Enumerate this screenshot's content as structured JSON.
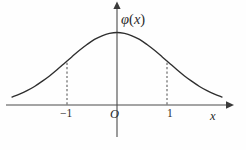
{
  "figure": {
    "kind": "math-plot",
    "width": 246,
    "height": 150,
    "background_color": "#fefefe",
    "curve_color": "#2e2e2e",
    "axis_color": "#4a4a4a",
    "dash_color": "#555555",
    "label_color": "#2b2b2b"
  },
  "labels": {
    "y_axis": "φ",
    "y_axis_arg_open": "(",
    "y_axis_arg": "x",
    "y_axis_arg_close": ")",
    "y_axis_full": "φ(x)",
    "origin": "O",
    "x_axis": "x",
    "tick_negative_one": "−1",
    "tick_positive_one": "1"
  },
  "bleed_through": {
    "top": "",
    "bottom": ""
  },
  "chart_data": {
    "type": "line",
    "title": "",
    "xlabel": "x",
    "ylabel": "φ(x)",
    "function": "phi(x) = (1/sqrt(2*pi)) * exp(-x^2/2)",
    "xlim": [
      -2.1,
      2.1
    ],
    "ylim": [
      0,
      0.46
    ],
    "grid": false,
    "legend": null,
    "xticks": [
      -1,
      1
    ],
    "xticklabels": [
      "−1",
      "1"
    ],
    "yticks": [],
    "yticklabels": [],
    "annotations": [
      {
        "text": "O",
        "x": 0,
        "y": 0,
        "role": "origin-marker"
      },
      {
        "text": "φ(x)",
        "x": 0,
        "y": 0.44,
        "role": "y-axis-label"
      },
      {
        "text": "x",
        "x": 2.0,
        "y": 0,
        "role": "x-axis-label"
      }
    ],
    "dashed_markers": [
      {
        "x": -1,
        "y_from": 0,
        "y_to": 0.242,
        "label": "−1"
      },
      {
        "x": 1,
        "y_from": 0,
        "y_to": 0.242,
        "label": "1"
      }
    ],
    "x": [
      -2.1,
      -1.95,
      -1.8,
      -1.65,
      -1.5,
      -1.35,
      -1.2,
      -1.05,
      -1.0,
      -0.9,
      -0.75,
      -0.6,
      -0.45,
      -0.3,
      -0.15,
      0.0,
      0.15,
      0.3,
      0.45,
      0.6,
      0.75,
      0.9,
      1.0,
      1.05,
      1.2,
      1.35,
      1.5,
      1.65,
      1.8,
      1.95,
      2.1
    ],
    "y": [
      0.044,
      0.06,
      0.079,
      0.102,
      0.13,
      0.16,
      0.194,
      0.23,
      0.242,
      0.266,
      0.301,
      0.333,
      0.361,
      0.381,
      0.394,
      0.399,
      0.394,
      0.381,
      0.361,
      0.333,
      0.301,
      0.266,
      0.242,
      0.23,
      0.194,
      0.16,
      0.13,
      0.102,
      0.079,
      0.06,
      0.044
    ]
  }
}
